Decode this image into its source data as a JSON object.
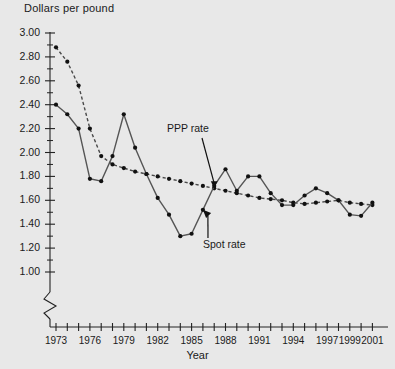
{
  "chart_data": {
    "type": "line",
    "title": "",
    "ylabel": "Dollars per pound",
    "xlabel": "Year",
    "ylim": [
      1.0,
      3.0
    ],
    "ytick_step": 0.2,
    "yticks": [
      "1.00",
      "1.20",
      "1.40",
      "1.60",
      "1.80",
      "2.00",
      "2.20",
      "2.40",
      "2.60",
      "2.80",
      "3.00"
    ],
    "axis_break": true,
    "grid": false,
    "legend_position": "inline-annotations",
    "xlim": [
      1973,
      2001
    ],
    "x": [
      1973,
      1974,
      1975,
      1976,
      1977,
      1978,
      1979,
      1980,
      1981,
      1982,
      1983,
      1984,
      1985,
      1986,
      1987,
      1988,
      1989,
      1990,
      1991,
      1992,
      1993,
      1994,
      1995,
      1996,
      1997,
      1998,
      1999,
      2000,
      2001
    ],
    "xticks": [
      1973,
      1974,
      1975,
      1976,
      1977,
      1978,
      1979,
      1980,
      1981,
      1982,
      1983,
      1984,
      1985,
      1986,
      1987,
      1988,
      1989,
      1990,
      1991,
      1992,
      1993,
      1994,
      1995,
      1996,
      1997,
      1998,
      1999,
      2000,
      2001
    ],
    "xtick_labels": [
      "1973",
      "1976",
      "1979",
      "1982",
      "1985",
      "1988",
      "1991",
      "1994",
      "1997",
      "1999",
      "2001"
    ],
    "xtick_label_years": [
      1973,
      1976,
      1979,
      1982,
      1985,
      1988,
      1991,
      1994,
      1997,
      1999,
      2001
    ],
    "series": [
      {
        "name": "PPP rate",
        "style": "dotted",
        "color": "#4a4a4a",
        "values": [
          2.88,
          2.76,
          2.56,
          2.2,
          1.97,
          1.9,
          1.87,
          1.84,
          1.82,
          1.8,
          1.78,
          1.76,
          1.74,
          1.72,
          1.7,
          1.68,
          1.66,
          1.64,
          1.62,
          1.61,
          1.6,
          1.58,
          1.57,
          1.58,
          1.59,
          1.6,
          1.58,
          1.57,
          1.56
        ]
      },
      {
        "name": "Spot rate",
        "style": "solid",
        "color": "#555555",
        "values": [
          2.4,
          2.32,
          2.2,
          1.78,
          1.76,
          1.97,
          2.32,
          2.04,
          1.82,
          1.62,
          1.48,
          1.3,
          1.32,
          1.52,
          1.72,
          1.86,
          1.68,
          1.8,
          1.8,
          1.66,
          1.56,
          1.56,
          1.64,
          1.7,
          1.66,
          1.6,
          1.48,
          1.47,
          1.58
        ]
      }
    ],
    "annotations": [
      {
        "text": "PPP rate",
        "target_year": 1987,
        "target_value": 1.7
      },
      {
        "text": "Spot rate",
        "target_year": 1986,
        "target_value": 1.52
      }
    ]
  }
}
